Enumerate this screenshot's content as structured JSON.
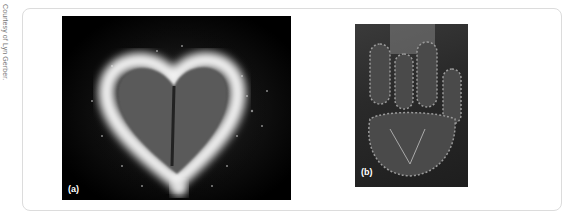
{
  "credit": "Courtesy of Lyn Gerber.",
  "figures": [
    {
      "label": "(a)",
      "subject": "heart-shaped leaf corona discharge image"
    },
    {
      "label": "(b)",
      "subject": "hand corona discharge image"
    }
  ],
  "colors": {
    "panel_border": "#dcdcdc",
    "credit_text": "#777777",
    "label_text": "#ffffff"
  }
}
